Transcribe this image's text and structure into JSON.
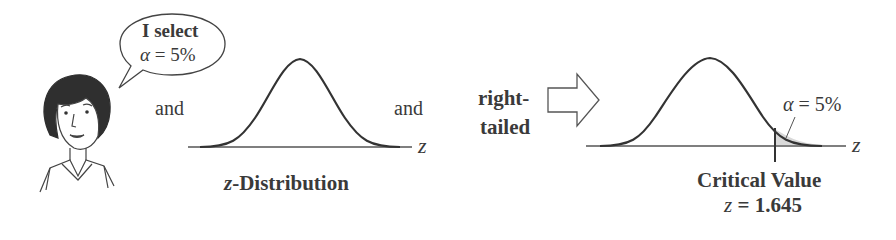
{
  "speech_bubble": {
    "line1": "I select",
    "line2_symbol": "α",
    "line2_rest": " = 5%"
  },
  "connectors": {
    "and_1": "and",
    "and_2": "and"
  },
  "distribution": {
    "axis_label": "z",
    "caption_var": "z",
    "caption_rest": "-Distribution"
  },
  "test_type": {
    "line1": "right-",
    "line2": "tailed"
  },
  "result": {
    "alpha_symbol": "α",
    "alpha_rest": " = 5%",
    "axis_label": "z",
    "critical_title": "Critical Value",
    "critical_var": "z",
    "critical_rest": " = 1.645"
  },
  "colors": {
    "ink": "#333333",
    "shade": "#d9d9d9"
  }
}
